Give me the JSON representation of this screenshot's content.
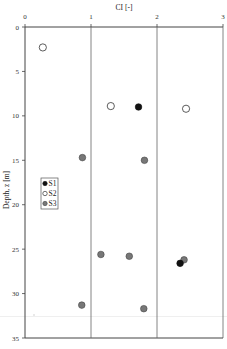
{
  "chart_data": {
    "type": "scatter",
    "title": "",
    "xlabel": "CI [-]",
    "ylabel": "Depth, z [m]",
    "xlim": [
      0,
      3
    ],
    "ylim": [
      35,
      0
    ],
    "x_ticks": [
      "0",
      "1",
      "2",
      "3"
    ],
    "y_ticks": [
      "0",
      "5",
      "10",
      "15",
      "20",
      "25",
      "30",
      "35"
    ],
    "grid": "vertical lines at x = 1, 2",
    "x_axis_position": "top",
    "legend_position": "left-middle inside plot",
    "series": [
      {
        "name": "S1",
        "marker": "filled-black-circle",
        "color": "#111111",
        "points": [
          {
            "x": 1.72,
            "y": 9.0
          },
          {
            "x": 2.35,
            "y": 26.6
          }
        ]
      },
      {
        "name": "S2",
        "marker": "open-circle",
        "color": "#ffffff",
        "points": [
          {
            "x": 0.27,
            "y": 2.3
          },
          {
            "x": 1.3,
            "y": 8.9
          },
          {
            "x": 2.44,
            "y": 9.2
          }
        ]
      },
      {
        "name": "S3",
        "marker": "gray-circle",
        "color": "#777777",
        "points": [
          {
            "x": 0.87,
            "y": 14.7
          },
          {
            "x": 1.81,
            "y": 15.0
          },
          {
            "x": 1.15,
            "y": 25.6
          },
          {
            "x": 1.58,
            "y": 25.8
          },
          {
            "x": 2.41,
            "y": 26.2
          },
          {
            "x": 0.86,
            "y": 31.3
          },
          {
            "x": 1.8,
            "y": 31.7
          }
        ]
      }
    ]
  },
  "axes": {
    "x_title": "CI [-]",
    "y_title": "Depth, z [m]"
  },
  "legend": [
    {
      "label": "S1"
    },
    {
      "label": "S2"
    },
    {
      "label": "S3"
    }
  ]
}
